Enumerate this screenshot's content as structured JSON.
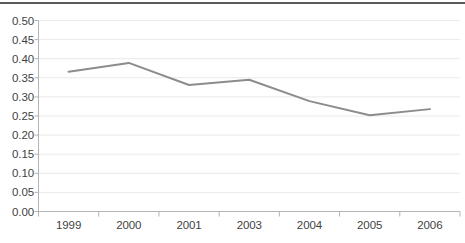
{
  "chart_data": {
    "type": "line",
    "title": "",
    "subtitle": "",
    "xlabel": "",
    "ylabel": "",
    "categories": [
      "1999",
      "2000",
      "2001",
      "2003",
      "2004",
      "2005",
      "2006"
    ],
    "values": [
      0.366,
      0.389,
      0.331,
      0.345,
      0.289,
      0.252,
      0.268
    ],
    "series": [
      {
        "name": "series-1",
        "values": [
          0.366,
          0.389,
          0.331,
          0.345,
          0.289,
          0.252,
          0.268
        ]
      }
    ],
    "ylim": [
      0.0,
      0.5
    ],
    "ytick_labels": [
      "0.00",
      "0.05",
      "0.10",
      "0.15",
      "0.20",
      "0.25",
      "0.30",
      "0.35",
      "0.40",
      "0.45",
      "0.50"
    ],
    "ytick_values": [
      0.0,
      0.05,
      0.1,
      0.15,
      0.2,
      0.25,
      0.3,
      0.35,
      0.4,
      0.45,
      0.5
    ],
    "grid": true,
    "grid_axis": "y",
    "legend": false,
    "legend_position": "none",
    "markers": false,
    "annotations": []
  },
  "style": {
    "line_color": "#8c8c8c",
    "grid_color": "#e9e9e9",
    "axis_color": "#b4b4b4",
    "text_color": "#3f3f3f",
    "top_rule_color": "#5a5a5a",
    "background": "#ffffff"
  }
}
